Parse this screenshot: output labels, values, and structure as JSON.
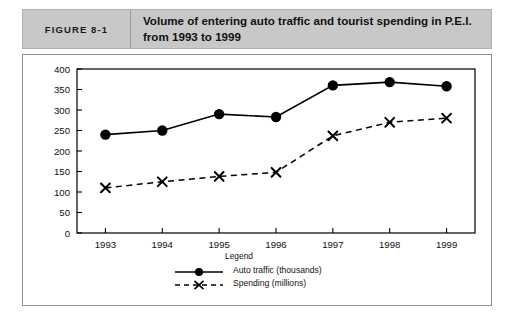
{
  "figure": {
    "number_label": "FIGURE 8-1",
    "title": "Volume of entering auto traffic and tourist spending in P.E.I. from 1993 to 1999"
  },
  "legend": {
    "title": "Legend",
    "entries": [
      {
        "label": "Auto traffic (thousands)",
        "marker": "filled-circle",
        "line": "solid"
      },
      {
        "label": "Spending (millions)",
        "marker": "x-cross",
        "line": "dashed"
      }
    ]
  },
  "colors": {
    "header_background": "#c8c8c8",
    "header_border": "#b0b0b0",
    "frame_border": "#8f8f8f",
    "axis": "#000000",
    "series_auto_traffic": "#000000",
    "series_spending": "#000000",
    "plot_background": "#ffffff"
  },
  "chart_data": {
    "type": "line",
    "title": "Volume of entering auto traffic and tourist spending in P.E.I. from 1993 to 1999",
    "xlabel": "",
    "ylabel": "",
    "categories": [
      "1993",
      "1994",
      "1995",
      "1996",
      "1997",
      "1998",
      "1999"
    ],
    "x": [
      1993,
      1994,
      1995,
      1996,
      1997,
      1998,
      1999
    ],
    "series": [
      {
        "name": "Auto traffic (thousands)",
        "values": [
          240,
          250,
          290,
          283,
          360,
          368,
          358
        ],
        "marker": "filled-circle",
        "linestyle": "solid"
      },
      {
        "name": "Spending (millions)",
        "values": [
          110,
          125,
          138,
          148,
          237,
          270,
          280
        ],
        "marker": "x-cross",
        "linestyle": "dashed"
      }
    ],
    "ylim": [
      0,
      400
    ],
    "yticks": [
      0,
      50,
      100,
      150,
      200,
      250,
      300,
      350,
      400
    ],
    "ytick_labels": [
      "0",
      "50",
      "100",
      "150",
      "200",
      "250",
      "300",
      "350",
      "400"
    ],
    "xtick_labels": [
      "1993",
      "1994",
      "1995",
      "1996",
      "1997",
      "1998",
      "1999"
    ],
    "grid": false,
    "legend_position": "bottom-center"
  }
}
